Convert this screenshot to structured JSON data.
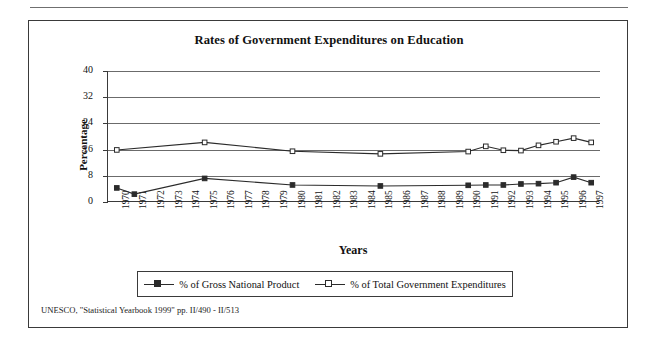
{
  "figure": {
    "title": "Rates of Government Expenditures on Education",
    "source_note": "UNESCO, \"Statistical Yearbook 1999\" pp. II/490 - II/513"
  },
  "chart_data": {
    "type": "line",
    "title": "Rates of Government Expenditures on Education",
    "xlabel": "Years",
    "ylabel": "Percentage",
    "ylim": [
      0,
      40
    ],
    "yticks": [
      0,
      8,
      16,
      24,
      32,
      40
    ],
    "grid": true,
    "legend_position": "bottom",
    "categories": [
      "1970",
      "1971",
      "1972",
      "1973",
      "1974",
      "1975",
      "1976",
      "1977",
      "1978",
      "1979",
      "1980",
      "1981",
      "1982",
      "1983",
      "1984",
      "1985",
      "1986",
      "1987",
      "1988",
      "1989",
      "1990",
      "1991",
      "1992",
      "1993",
      "1994",
      "1995",
      "1996",
      "1997"
    ],
    "series": [
      {
        "name": "% of Gross National Product",
        "marker": "filled-square",
        "points": [
          {
            "x": "1970",
            "y": 4.3
          },
          {
            "x": "1971",
            "y": 2.4
          },
          {
            "x": "1975",
            "y": 7.2
          },
          {
            "x": "1980",
            "y": 5.2
          },
          {
            "x": "1985",
            "y": 4.9
          },
          {
            "x": "1990",
            "y": 5.1
          },
          {
            "x": "1991",
            "y": 5.2
          },
          {
            "x": "1992",
            "y": 5.2
          },
          {
            "x": "1993",
            "y": 5.5
          },
          {
            "x": "1994",
            "y": 5.6
          },
          {
            "x": "1995",
            "y": 5.9
          },
          {
            "x": "1996",
            "y": 7.6
          },
          {
            "x": "1997",
            "y": 5.9
          }
        ]
      },
      {
        "name": "% of Total Government Expenditures",
        "marker": "open-square",
        "points": [
          {
            "x": "1970",
            "y": 15.9
          },
          {
            "x": "1975",
            "y": 18.2
          },
          {
            "x": "1980",
            "y": 15.5
          },
          {
            "x": "1985",
            "y": 14.7
          },
          {
            "x": "1990",
            "y": 15.4
          },
          {
            "x": "1991",
            "y": 17.0
          },
          {
            "x": "1992",
            "y": 15.8
          },
          {
            "x": "1993",
            "y": 15.7
          },
          {
            "x": "1994",
            "y": 17.3
          },
          {
            "x": "1995",
            "y": 18.4
          },
          {
            "x": "1996",
            "y": 19.5
          },
          {
            "x": "1997",
            "y": 18.2
          }
        ]
      }
    ]
  },
  "legend": {
    "items": [
      {
        "label": "% of Gross National Product",
        "marker": "filled-square"
      },
      {
        "label": "% of Total Government Expenditures",
        "marker": "open-square"
      }
    ]
  }
}
